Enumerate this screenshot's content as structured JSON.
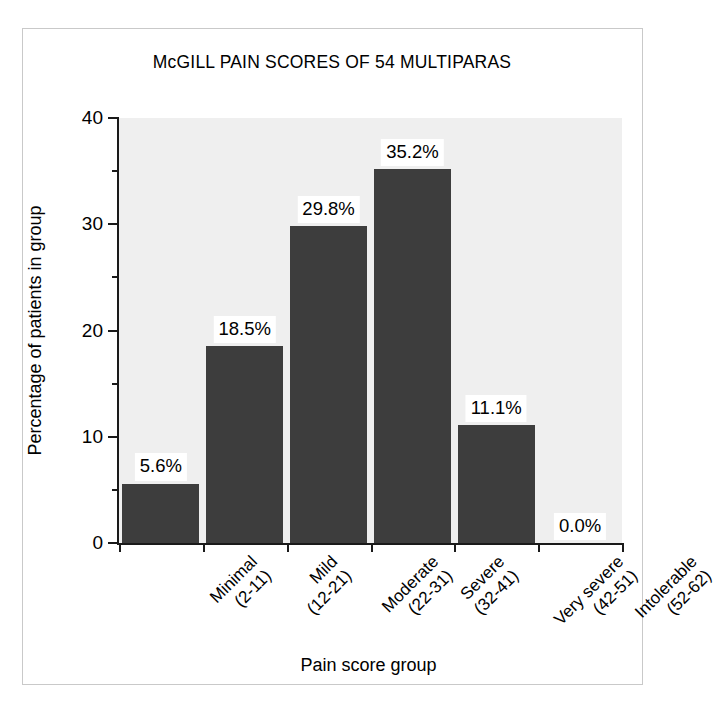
{
  "chart_data": {
    "type": "bar",
    "title": "McGILL PAIN SCORES OF 54 MULTIPARAS",
    "xlabel": "Pain score group",
    "ylabel": "Percentage of patients in group",
    "categories": [
      "Minimal (2-11)",
      "Mild (12-21)",
      "Moderate (22-31)",
      "Severe (32-41)",
      "Very severe (42-51)",
      "Intolerable (52-62)"
    ],
    "category_lines": [
      {
        "line1": "Minimal",
        "line2": "(2-11)"
      },
      {
        "line1": "Mild",
        "line2": "(12-21)"
      },
      {
        "line1": "Moderate",
        "line2": "(22-31)"
      },
      {
        "line1": "Severe",
        "line2": "(32-41)"
      },
      {
        "line1": "Very severe",
        "line2": "(42-51)"
      },
      {
        "line1": "Intolerable",
        "line2": "(52-62)"
      }
    ],
    "values": [
      5.6,
      18.5,
      29.8,
      35.2,
      11.1,
      0.0
    ],
    "value_labels": [
      "5.6%",
      "18.5%",
      "29.8%",
      "35.2%",
      "11.1%",
      "0.0%"
    ],
    "ylim": [
      0,
      40
    ],
    "ytick_labels": [
      "0",
      "10",
      "20",
      "30",
      "40"
    ],
    "ytick_values": [
      0,
      10,
      20,
      30,
      40
    ],
    "yminor_values": [
      5,
      15,
      25,
      35
    ],
    "grid": false,
    "legend": null,
    "bar_color": "#3d3d3d",
    "plot_background": "#efefef",
    "axis_color": "#1a1a1a",
    "frame_color": "#c9c9c9"
  }
}
